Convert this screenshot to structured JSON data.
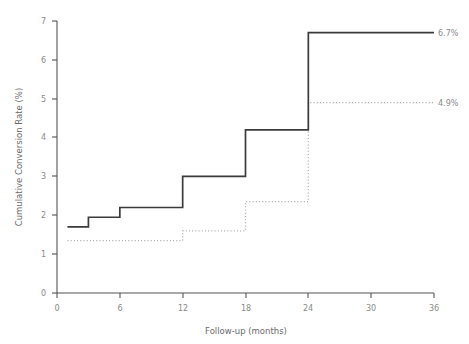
{
  "chart_data": {
    "type": "line",
    "title": "",
    "subtitle": "",
    "xlabel": "Follow-up (months)",
    "ylabel": "Cumulative Conversion Rate (%)",
    "xlim": [
      0,
      36
    ],
    "ylim": [
      0,
      7
    ],
    "xticks": [
      0,
      6,
      12,
      18,
      24,
      30,
      36
    ],
    "yticks": [
      0,
      1,
      2,
      3,
      4,
      5,
      6,
      7
    ],
    "xtick_labels": [
      "0",
      "6",
      "12",
      "18",
      "24",
      "30",
      "36"
    ],
    "ytick_labels": [
      "0",
      "1",
      "2",
      "3",
      "4",
      "5",
      "6",
      "7"
    ],
    "grid": false,
    "legend": "none",
    "step_mode": "post",
    "series": [
      {
        "name": "solid-series",
        "style": "solid",
        "color": "#3b3b3b",
        "end_label": "6.7%",
        "end_value": 6.7,
        "x": [
          1,
          3,
          6,
          12,
          18,
          24,
          36
        ],
        "values": [
          1.7,
          1.95,
          2.2,
          3.0,
          4.2,
          6.7,
          6.7
        ]
      },
      {
        "name": "dotted-series",
        "style": "dotted",
        "color": "#a9a9a9",
        "end_label": "4.9%",
        "end_value": 4.9,
        "x": [
          1,
          12,
          18,
          24,
          36
        ],
        "values": [
          1.35,
          1.6,
          2.35,
          4.9,
          4.9
        ]
      }
    ]
  },
  "labels": {
    "xaxis_title": "Follow-up (months)",
    "yaxis_title": "Cumulative Conversion Rate (%)",
    "x0": "0",
    "x6": "6",
    "x12": "12",
    "x18": "18",
    "x24": "24",
    "x30": "30",
    "x36": "36",
    "y0": "0",
    "y1": "1",
    "y2": "2",
    "y3": "3",
    "y4": "4",
    "y5": "5",
    "y6": "6",
    "y7": "7",
    "solid_end": "6.7%",
    "dotted_end": "4.9%"
  }
}
